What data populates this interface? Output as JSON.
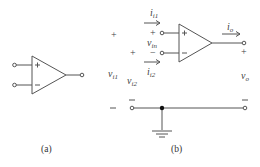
{
  "figure": {
    "panel_a": {
      "caption": "(a)",
      "opamp": {
        "plus_sign": "+",
        "minus_sign": "−"
      }
    },
    "panel_b": {
      "caption": "(b)",
      "opamp": {
        "plus_sign": "+",
        "minus_sign": "−"
      },
      "labels": {
        "i_i1": {
          "main": "i",
          "sub": "i1"
        },
        "i_i2": {
          "main": "i",
          "sub": "i2"
        },
        "v_in": {
          "main": "v",
          "sub": "in"
        },
        "v_i1": {
          "main": "v",
          "sub": "i1"
        },
        "v_i2": {
          "main": "v",
          "sub": "i2"
        },
        "i_o": {
          "main": "i",
          "sub": "o"
        },
        "v_o": {
          "main": "v",
          "sub": "o"
        }
      },
      "polarity": {
        "vi1_plus": "+",
        "vi1_minus": "−",
        "vi2_plus": "+",
        "vi2_minus": "−",
        "vin_plus": "+",
        "vin_minus": "−",
        "vo_plus": "+",
        "vo_minus": "−"
      }
    },
    "colors": {
      "line": "#555555",
      "node": "#111111"
    }
  }
}
